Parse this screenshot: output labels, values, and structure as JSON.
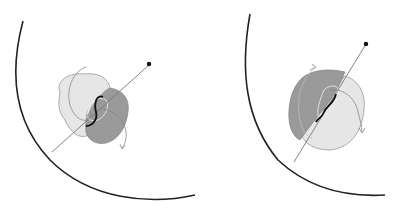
{
  "figure": {
    "panels": [
      {
        "id": "left",
        "description": "Left panel: large arc boundary, light and dark overlapping lobes, pointer line ending in dot, dark S-shaped curve and thin trajectory curves with arrowheads"
      },
      {
        "id": "right",
        "description": "Right panel: large arc boundary, dark and light overlapping lobes (mirrored shading), pointer line ending in dot, dark S-shaped curve and thin trajectory curves with arrowheads"
      }
    ],
    "colors": {
      "background": "#ffffff",
      "arc": "#222222",
      "light_lobe": "#e6e6e6",
      "dark_lobe": "#9a9a9a",
      "lobe_outline": "#8a8a8a",
      "pointer_line": "#777777",
      "dot": "#111111",
      "s_curve": "#111111",
      "trajectory": "#888888"
    }
  }
}
